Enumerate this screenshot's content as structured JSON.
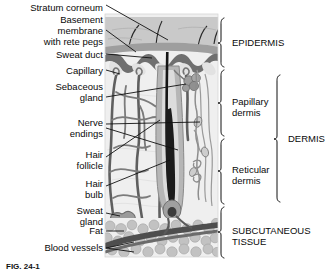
{
  "figure": {
    "caption": "FIG. 24-1"
  },
  "left_labels": [
    {
      "text": "Stratum corneum",
      "x": 103,
      "y": 7,
      "name": "label-stratum-corneum"
    },
    {
      "text": "Basement",
      "x": 103,
      "y": 19,
      "name": "label-basement-membrane-line1"
    },
    {
      "text": "membrane",
      "x": 103,
      "y": 29,
      "name": "label-basement-membrane-line2"
    },
    {
      "text": "with rete pegs",
      "x": 103,
      "y": 39,
      "name": "label-basement-membrane-line3"
    },
    {
      "text": "Sweat duct",
      "x": 103,
      "y": 57,
      "name": "label-sweat-duct"
    },
    {
      "text": "Capillary",
      "x": 103,
      "y": 72,
      "name": "label-capillary"
    },
    {
      "text": "Sebaceous",
      "x": 103,
      "y": 88,
      "name": "label-sebaceous-gland-line1"
    },
    {
      "text": "gland",
      "x": 103,
      "y": 99,
      "name": "label-sebaceous-gland-line2"
    },
    {
      "text": "Nerve",
      "x": 103,
      "y": 119,
      "name": "label-nerve-endings-line1"
    },
    {
      "text": "endings",
      "x": 103,
      "y": 130,
      "name": "label-nerve-endings-line2"
    },
    {
      "text": "Hair",
      "x": 103,
      "y": 148,
      "name": "label-hair-follicle-line1"
    },
    {
      "text": "follicle",
      "x": 103,
      "y": 159,
      "name": "label-hair-follicle-line2"
    },
    {
      "text": "Hair",
      "x": 103,
      "y": 177,
      "name": "label-hair-bulb-line1"
    },
    {
      "text": "bulb",
      "x": 103,
      "y": 188,
      "name": "label-hair-bulb-line2"
    },
    {
      "text": "Sweat",
      "x": 103,
      "y": 206,
      "name": "label-sweat-gland-line1"
    },
    {
      "text": "gland",
      "x": 103,
      "y": 217,
      "name": "label-sweat-gland-line2"
    },
    {
      "text": "Fat",
      "x": 103,
      "y": 232,
      "name": "label-fat"
    },
    {
      "text": "Blood vessels",
      "x": 103,
      "y": 250,
      "name": "label-blood-vessels"
    }
  ],
  "right_labels": [
    {
      "text": "EPIDERMIS",
      "x": 232,
      "y": 38,
      "name": "label-epidermis"
    },
    {
      "text": "Papillary",
      "x": 232,
      "y": 98,
      "name": "label-papillary-dermis-line1"
    },
    {
      "text": "dermis",
      "x": 232,
      "y": 109,
      "name": "label-papillary-dermis-line2"
    },
    {
      "text": "Reticular",
      "x": 232,
      "y": 166,
      "name": "label-reticular-dermis-line1"
    },
    {
      "text": "dermis",
      "x": 232,
      "y": 177,
      "name": "label-reticular-dermis-line2"
    },
    {
      "text": "DERMIS",
      "x": 288,
      "y": 139,
      "name": "label-dermis"
    },
    {
      "text": "SUBCUTANEOUS",
      "x": 232,
      "y": 226,
      "name": "label-subcutaneous-tissue-line1"
    },
    {
      "text": "TISSUE",
      "x": 232,
      "y": 238,
      "name": "label-subcutaneous-tissue-line2"
    }
  ],
  "brackets": [
    {
      "name": "bracket-epidermis",
      "x": 221,
      "top": 18,
      "bottom": 67,
      "tip": 43
    },
    {
      "name": "bracket-papillary",
      "x": 221,
      "top": 70,
      "bottom": 136,
      "tip": 103
    },
    {
      "name": "bracket-reticular",
      "x": 221,
      "top": 139,
      "bottom": 204,
      "tip": 171
    },
    {
      "name": "bracket-subcutaneous",
      "x": 221,
      "top": 207,
      "bottom": 258,
      "tip": 232
    },
    {
      "name": "bracket-dermis",
      "x": 277,
      "top": 75,
      "bottom": 202,
      "tip": 139
    }
  ],
  "colors": {
    "stratum_corneum": "#c9c9c9",
    "epidermis_band": "#9a9a9a",
    "basement_membrane": "#6d6d6d",
    "dermis_bg": "#ebebeb",
    "vessel_dark": "#5a5a5a",
    "vessel_mid": "#767676",
    "fat": "#bdbdbd",
    "hair_shaft": "#1a1a1a",
    "follicle": "#a8a8a8",
    "line": "#111111",
    "text": "#0a0a0a"
  },
  "structures": [
    "stratum corneum",
    "basement membrane with rete pegs",
    "sweat duct",
    "capillary",
    "sebaceous gland",
    "nerve endings",
    "hair follicle",
    "hair bulb",
    "sweat gland",
    "fat",
    "blood vessels"
  ]
}
